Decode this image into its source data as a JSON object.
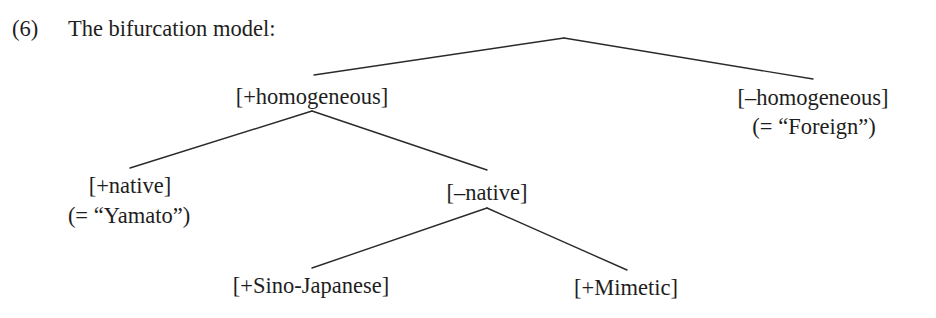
{
  "example": {
    "number": "(6)",
    "title": "The bifurcation model:"
  },
  "tree": {
    "root": "",
    "nodes": {
      "plus_homogeneous": {
        "label": "[+homogeneous]"
      },
      "minus_homogeneous": {
        "label": "[–homogeneous]",
        "gloss": "(= “Foreign”)"
      },
      "plus_native": {
        "label": "[+native]",
        "gloss": "(= “Yamato”)"
      },
      "minus_native": {
        "label": "[–native]"
      },
      "plus_sino_japanese": {
        "label": "[+Sino-Japanese]"
      },
      "plus_mimetic": {
        "label": "[+Mimetic]"
      }
    },
    "edges": [
      {
        "from": "root",
        "to": "plus_homogeneous"
      },
      {
        "from": "root",
        "to": "minus_homogeneous"
      },
      {
        "from": "plus_homogeneous",
        "to": "plus_native"
      },
      {
        "from": "plus_homogeneous",
        "to": "minus_native"
      },
      {
        "from": "minus_native",
        "to": "plus_sino_japanese"
      },
      {
        "from": "minus_native",
        "to": "plus_mimetic"
      }
    ]
  }
}
